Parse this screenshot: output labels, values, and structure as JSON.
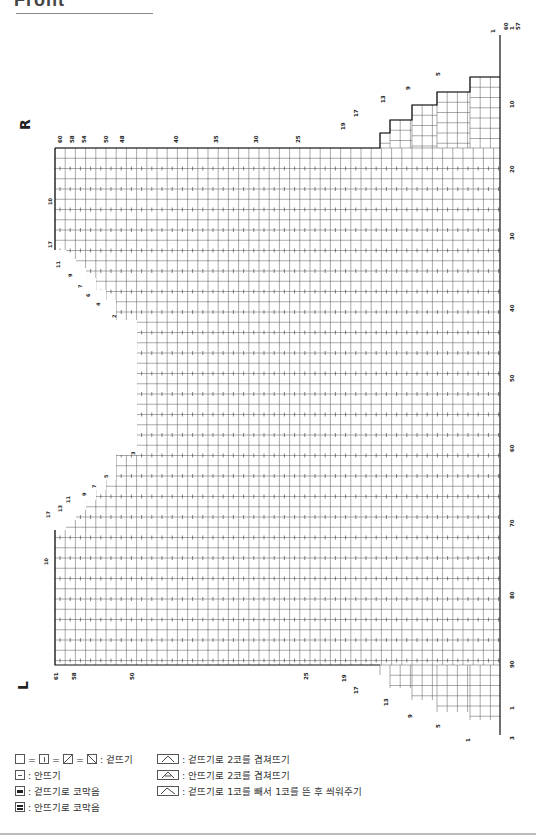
{
  "header": {
    "title": "Front"
  },
  "chart": {
    "side_labels": {
      "right_side": "R",
      "left_side": "L"
    },
    "top_stitch_labels": [
      "60",
      "58",
      "54",
      "50",
      "48",
      "40",
      "35",
      "30",
      "25",
      "19",
      "17",
      "13",
      "9",
      "5",
      "1",
      "60",
      "57"
    ],
    "bottom_stitch_labels": [
      "61",
      "58",
      "50",
      "25",
      "19",
      "17",
      "13",
      "9",
      "5",
      "1"
    ],
    "row_labels": [
      "1",
      "10",
      "20",
      "30",
      "40",
      "50",
      "60",
      "70",
      "80",
      "90",
      "1",
      "3"
    ],
    "neck_left_labels": [
      "10",
      "17",
      "11",
      "9",
      "7",
      "6",
      "4",
      "2",
      "3",
      "5",
      "7",
      "9",
      "11",
      "13",
      "17",
      "10"
    ],
    "colors": {
      "grid_line": "#333333",
      "outline": "#111111",
      "background": "#ffffff"
    }
  },
  "legend": {
    "items": [
      {
        "symbol": "knit-variants",
        "label": ": 겉뜨기"
      },
      {
        "symbol": "purl",
        "label": ": 안뜨기"
      },
      {
        "symbol": "bind-off-knit",
        "label": ": 겉뜨기로 코막음"
      },
      {
        "symbol": "bind-off-purl",
        "label": ": 안뜨기로 코막음"
      },
      {
        "symbol": "k2tog",
        "label": ": 겉뜨기로 2코를 겹쳐뜨기"
      },
      {
        "symbol": "p2tog",
        "label": ": 안뜨기로 2코를 겹쳐뜨기"
      },
      {
        "symbol": "skp",
        "label": ": 겉뜨기로 1코를 빼서 1코를 뜬 후 씌워주기"
      }
    ]
  }
}
